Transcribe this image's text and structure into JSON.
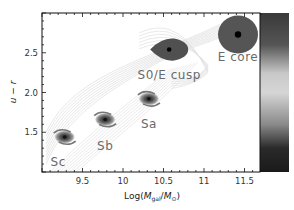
{
  "chart_data": {
    "type": "scatter",
    "title": "",
    "xlabel": "Log(M_gal/M_sun)",
    "xlabel_parts": {
      "pre": "Log(",
      "m1": "M",
      "sub1": "gal",
      "slash": "/",
      "m2": "M",
      "sub2": "⊙",
      "post": ")"
    },
    "ylabel": "u − r",
    "xlim": [
      9.0,
      11.7
    ],
    "ylim": [
      1.0,
      3.0
    ],
    "xticks": [
      9.5,
      10,
      10.5,
      11,
      11.5
    ],
    "xtick_labels": [
      "9.5",
      "10",
      "10.5",
      "11",
      "11.5"
    ],
    "yticks": [
      1.5,
      2.0,
      2.5
    ],
    "ytick_labels": [
      "1.5",
      "2.0",
      "2.5"
    ],
    "grid": false,
    "colorbar": {
      "stops": [
        "#3a3a3a",
        "#555555",
        "#c8c8c8",
        "#d6d6d6",
        "#8a8a8a",
        "#2a2a2a",
        "#1a1a1a"
      ]
    },
    "points": [
      {
        "label": "Sc",
        "type": "spiral",
        "x": 9.28,
        "y": 1.44,
        "label_x": 9.2,
        "label_y": 1.13
      },
      {
        "label": "Sb",
        "type": "spiral",
        "x": 9.78,
        "y": 1.66,
        "label_x": 9.78,
        "label_y": 1.33
      },
      {
        "label": "Sa",
        "type": "spiral",
        "x": 10.32,
        "y": 1.92,
        "label_x": 10.32,
        "label_y": 1.6
      },
      {
        "label": "S0/E cusp",
        "type": "elliptical-cusp",
        "x": 10.57,
        "y": 2.54,
        "label_x": 10.57,
        "label_y": 2.22
      },
      {
        "label": "E core",
        "type": "elliptical-core",
        "x": 11.42,
        "y": 2.73,
        "label_x": 11.42,
        "label_y": 2.45
      }
    ],
    "contours": "background density contours (light grey)"
  }
}
